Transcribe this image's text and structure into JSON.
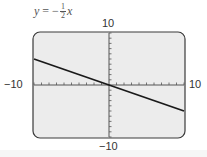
{
  "equation": {
    "lhs": "y",
    "equals": "=",
    "sign": "−",
    "numerator": "1",
    "denominator": "2",
    "variable": "x"
  },
  "labels": {
    "y_max": "10",
    "y_min": "−10",
    "x_min": "−10",
    "x_max": "10"
  },
  "colors": {
    "screen_bg": "#ececec",
    "frame": "#3a3a3a",
    "line": "#1a1a1a"
  },
  "chart_data": {
    "type": "line",
    "xlabel": "",
    "ylabel": "",
    "xlim": [
      -10,
      10
    ],
    "ylim": [
      -10,
      10
    ],
    "x_ticks_every": 1,
    "y_ticks_every": 1,
    "grid": false,
    "series": [
      {
        "name": "y = -1/2 x",
        "x": [
          -10,
          10
        ],
        "values": [
          5,
          -5
        ]
      }
    ]
  }
}
